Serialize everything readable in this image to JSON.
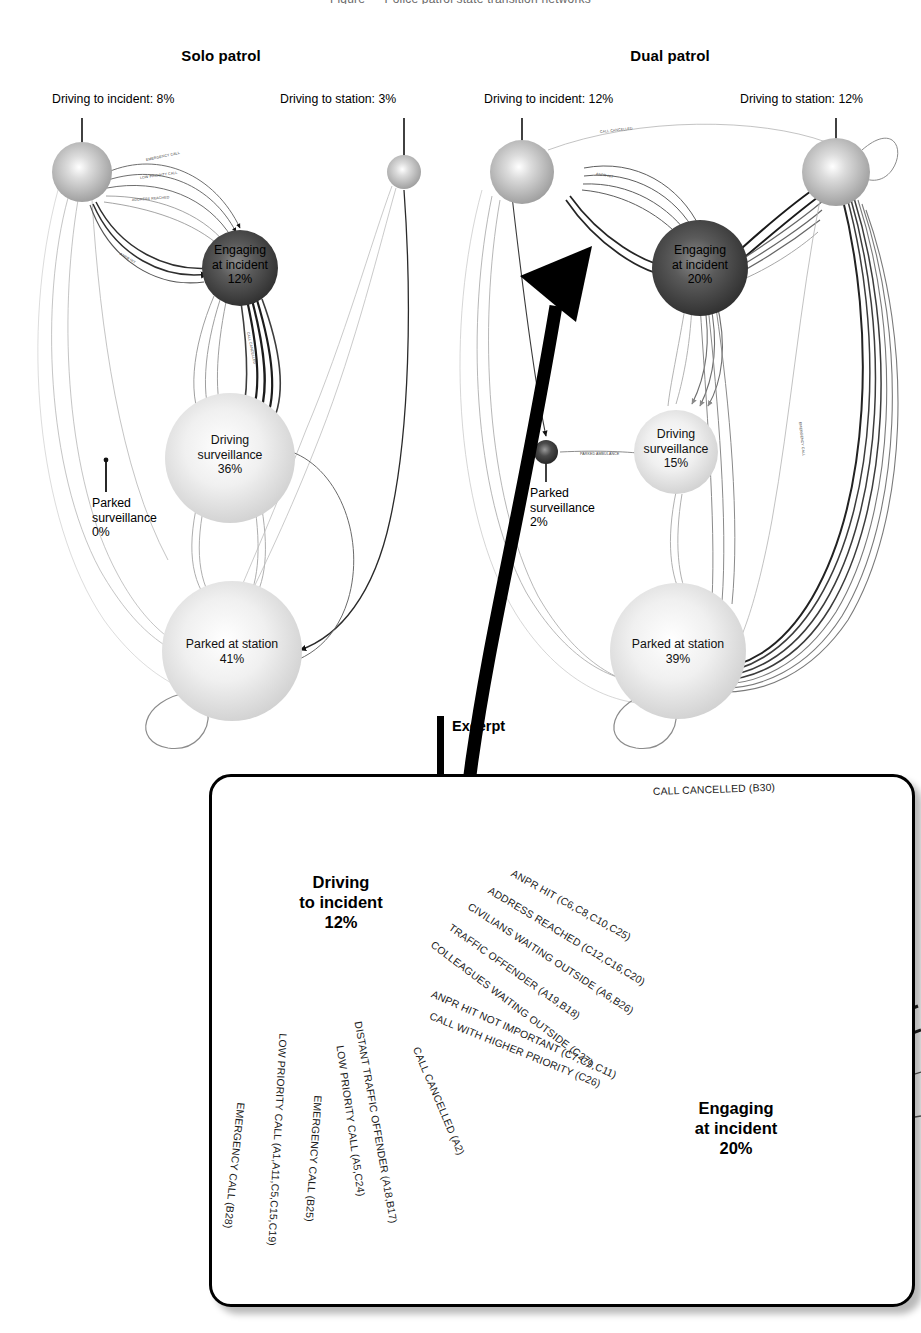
{
  "figure": {
    "cropped_header": "Figure — Police patrol state transition networks",
    "panels": [
      {
        "id": "solo",
        "title": "Solo patrol",
        "nodes": [
          {
            "key": "driving_to_incident",
            "caption": "Driving to incident: 8%",
            "label": "",
            "value": "8%",
            "style": "external-caption"
          },
          {
            "key": "driving_to_station",
            "caption": "Driving to station: 3%",
            "label": "",
            "value": "3%",
            "style": "external-caption"
          },
          {
            "key": "engaging_at_incident",
            "label_line1": "Engaging",
            "label_line2": "at incident",
            "value": "12%",
            "style": "inside-dark"
          },
          {
            "key": "driving_surveillance",
            "label_line1": "Driving",
            "label_line2": "surveillance",
            "value": "36%",
            "style": "inside-light"
          },
          {
            "key": "parked_surveillance",
            "label_line1": "Parked",
            "label_line2": "surveillance",
            "value": "0%",
            "style": "external-caption"
          },
          {
            "key": "parked_at_station",
            "label_line1": "Parked at station",
            "label_line2": "",
            "value": "41%",
            "style": "inside-light"
          }
        ]
      },
      {
        "id": "dual",
        "title": "Dual patrol",
        "nodes": [
          {
            "key": "driving_to_incident",
            "caption": "Driving to incident: 12%",
            "label": "",
            "value": "12%",
            "style": "external-caption"
          },
          {
            "key": "driving_to_station",
            "caption": "Driving to station: 12%",
            "label": "",
            "value": "12%",
            "style": "external-caption"
          },
          {
            "key": "engaging_at_incident",
            "label_line1": "Engaging",
            "label_line2": "at incident",
            "value": "20%",
            "style": "inside-dark"
          },
          {
            "key": "driving_surveillance",
            "label_line1": "Driving",
            "label_line2": "surveillance",
            "value": "15%",
            "style": "inside-light"
          },
          {
            "key": "parked_surveillance",
            "label_line1": "Parked",
            "label_line2": "surveillance",
            "value": "2%",
            "style": "external-caption"
          },
          {
            "key": "parked_at_station",
            "label_line1": "Parked at station",
            "label_line2": "",
            "value": "39%",
            "style": "inside-light"
          }
        ]
      }
    ],
    "excerpt": {
      "title": "Excerpt",
      "nodes": [
        {
          "key": "driving_to_incident",
          "line1": "Driving",
          "line2": "to incident",
          "value": "12%"
        },
        {
          "key": "engaging_at_incident",
          "line1": "Engaging",
          "line2": "at incident",
          "value": "20%"
        }
      ],
      "edges": [
        {
          "id": "e1",
          "label": "CALL CANCELLED (B30)",
          "direction": "incident-to-driving",
          "weight": "thin"
        },
        {
          "id": "e2",
          "label": "ANPR HIT (C6,C8,C10,C25)",
          "direction": "driving-to-incident",
          "weight": "medium"
        },
        {
          "id": "e3",
          "label": "ADDRESS REACHED (C12,C16,C20)",
          "direction": "driving-to-incident",
          "weight": "medium"
        },
        {
          "id": "e4",
          "label": "CIVILIANS WAITING OUTSIDE (A6,B26)",
          "direction": "driving-to-incident",
          "weight": "medium"
        },
        {
          "id": "e5",
          "label": "TRAFFIC OFFENDER (A19,B18)",
          "direction": "driving-to-incident",
          "weight": "medium"
        },
        {
          "id": "e6",
          "label": "COLLEAGUES WAITING OUTSIDE (C27)",
          "direction": "driving-to-incident",
          "weight": "medium"
        },
        {
          "id": "e7",
          "label": "ANPR HIT NOT IMPORTANT (C7,C9,C11)",
          "direction": "incident-to-driving",
          "weight": "bold"
        },
        {
          "id": "e8",
          "label": "CALL WITH HIGHER PRIORITY (C26)",
          "direction": "incident-to-driving",
          "weight": "bold"
        },
        {
          "id": "e9",
          "label": "EMERGENCY CALL (B28)",
          "direction": "in",
          "weight": "medium"
        },
        {
          "id": "e10",
          "label": "LOW PRIORITY CALL (A1,A11,C5,C15,C19)",
          "direction": "in",
          "weight": "medium"
        },
        {
          "id": "e11",
          "label": "EMERGENCY CALL (B25)",
          "direction": "in",
          "weight": "bold"
        },
        {
          "id": "e12",
          "label": "LOW PRIORITY CALL (A5,C24)",
          "direction": "in",
          "weight": "medium"
        },
        {
          "id": "e13",
          "label": "DISTANT TRAFFIC OFFENDER (A18,B17)",
          "direction": "out",
          "weight": "thin"
        },
        {
          "id": "e14",
          "label": "CALL CANCELLED (A2)",
          "direction": "out",
          "weight": "thin"
        }
      ]
    },
    "colors": {
      "dark_node": "#3b3b3b",
      "mid_node": "#8f8f8f",
      "light_node": "#d8d8d8",
      "edge": "#6b6b6b",
      "text": "#000000",
      "border": "#000000"
    }
  }
}
